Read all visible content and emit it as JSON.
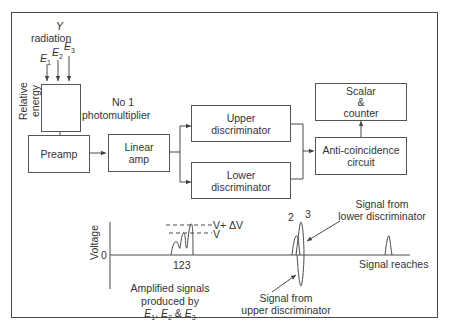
{
  "diagram": {
    "radiation": {
      "symbol": "Y",
      "label": "radiation"
    },
    "energies": [
      "E1",
      "E2",
      "E3"
    ],
    "energy_labels": {
      "e1": "E",
      "e1_sub": "1",
      "e2": "E",
      "e2_sub": "2",
      "e3": "E",
      "e3_sub": "3"
    },
    "axis_relative_energy": [
      "Relative",
      "energy"
    ],
    "photomultiplier": [
      "No 1",
      "photomultiplier"
    ],
    "blocks": {
      "preamp": "Preamp",
      "linear_amp": [
        "Linear",
        "amp"
      ],
      "upper_disc": [
        "Upper",
        "discriminator"
      ],
      "lower_disc": [
        "Lower",
        "discriminator"
      ],
      "anti_coinc": [
        "Anti-coincidence",
        "circuit"
      ],
      "scalar": [
        "Scalar",
        "&",
        "counter"
      ]
    },
    "plot": {
      "ylabel": "Voltage",
      "zero_label": "0",
      "level_upper": "V+ ΔV",
      "level_lower": "V",
      "peaks_label": "123",
      "peak2_label": "2",
      "peak3_label": "3",
      "caption": [
        "Amplified signals",
        "produced by"
      ],
      "caption_energies": {
        "e1": "E",
        "s1": "1",
        "e2": "E",
        "s2": "2",
        "e3": "E",
        "s3": "3",
        "sep1": ", ",
        "sep2": " & "
      },
      "upper_note": [
        "Signal from",
        "upper discriminator"
      ],
      "lower_note": [
        "Signal from",
        "lower discriminator"
      ],
      "reaches_note": "Signal reaches"
    },
    "colors": {
      "line": "#4a4a4a",
      "text": "#333333",
      "background": "#ffffff"
    }
  }
}
